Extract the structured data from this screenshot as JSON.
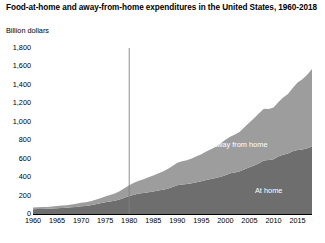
{
  "chart_data": {
    "type": "area",
    "stacked": true,
    "title": "Food-at-home and away-from-home expenditures in the United States, 1960-2018",
    "subtitle": "",
    "xlabel": "",
    "ylabel": "Billion dollars",
    "ylim": [
      0,
      1800
    ],
    "xlim": [
      1960,
      2018
    ],
    "grid": false,
    "legend_position": "in-plot-labels",
    "y_ticks": [
      "0",
      "200",
      "400",
      "600",
      "800",
      "1,000",
      "1,200",
      "1,400",
      "1,600",
      "1,800"
    ],
    "y_tick_values": [
      0,
      200,
      400,
      600,
      800,
      1000,
      1200,
      1400,
      1600,
      1800
    ],
    "x_ticks": [
      "1960",
      "1965",
      "1970",
      "1975",
      "1980",
      "1985",
      "1990",
      "1995",
      "2000",
      "2005",
      "2010",
      "2015"
    ],
    "x_tick_values": [
      1960,
      1965,
      1970,
      1975,
      1980,
      1985,
      1990,
      1995,
      2000,
      2005,
      2010,
      2015
    ],
    "x": [
      1960,
      1961,
      1962,
      1963,
      1964,
      1965,
      1966,
      1967,
      1968,
      1969,
      1970,
      1971,
      1972,
      1973,
      1974,
      1975,
      1976,
      1977,
      1978,
      1979,
      1980,
      1981,
      1982,
      1983,
      1984,
      1985,
      1986,
      1987,
      1988,
      1989,
      1990,
      1991,
      1992,
      1993,
      1994,
      1995,
      1996,
      1997,
      1998,
      1999,
      2000,
      2001,
      2002,
      2003,
      2004,
      2005,
      2006,
      2007,
      2008,
      2009,
      2010,
      2011,
      2012,
      2013,
      2014,
      2015,
      2016,
      2017,
      2018
    ],
    "series": [
      {
        "name": "At home",
        "color": "#6e6e6e",
        "values": [
          52,
          53,
          55,
          56,
          59,
          62,
          66,
          68,
          72,
          77,
          84,
          88,
          94,
          105,
          117,
          128,
          135,
          143,
          157,
          175,
          194,
          210,
          221,
          228,
          235,
          243,
          254,
          262,
          274,
          292,
          312,
          321,
          326,
          334,
          344,
          355,
          369,
          380,
          390,
          404,
          421,
          441,
          450,
          464,
          486,
          506,
          527,
          550,
          580,
          586,
          594,
          623,
          642,
          656,
          680,
          695,
          700,
          714,
          732
        ]
      },
      {
        "name": "Away from home",
        "color": "#9d9d9d",
        "values": [
          18,
          19,
          20,
          21,
          22,
          24,
          26,
          28,
          31,
          34,
          37,
          40,
          44,
          49,
          55,
          63,
          71,
          79,
          90,
          103,
          117,
          130,
          140,
          150,
          163,
          174,
          186,
          199,
          214,
          229,
          245,
          251,
          258,
          268,
          281,
          294,
          308,
          322,
          339,
          360,
          383,
          398,
          412,
          429,
          457,
          485,
          514,
          543,
          562,
          552,
          561,
          590,
          620,
          645,
          686,
          730,
          760,
          796,
          840
        ]
      }
    ],
    "totals": [
      70,
      72,
      75,
      77,
      81,
      86,
      92,
      96,
      103,
      111,
      121,
      128,
      138,
      154,
      172,
      191,
      206,
      222,
      247,
      278,
      311,
      340,
      361,
      378,
      398,
      417,
      440,
      461,
      488,
      521,
      557,
      572,
      584,
      602,
      625,
      649,
      677,
      702,
      729,
      764,
      804,
      839,
      862,
      893,
      943,
      991,
      1041,
      1093,
      1142,
      1138,
      1155,
      1213,
      1262,
      1301,
      1366,
      1425,
      1460,
      1510,
      1572
    ],
    "annotations": [
      {
        "name": "reference-line-1980",
        "type": "vertical-line",
        "x": 1980,
        "color": "#808080",
        "label": ""
      }
    ],
    "series_labels": [
      {
        "text": "Away from home",
        "x": 2003,
        "y": 760
      },
      {
        "text": "At home",
        "x": 2009,
        "y": 265
      }
    ]
  }
}
